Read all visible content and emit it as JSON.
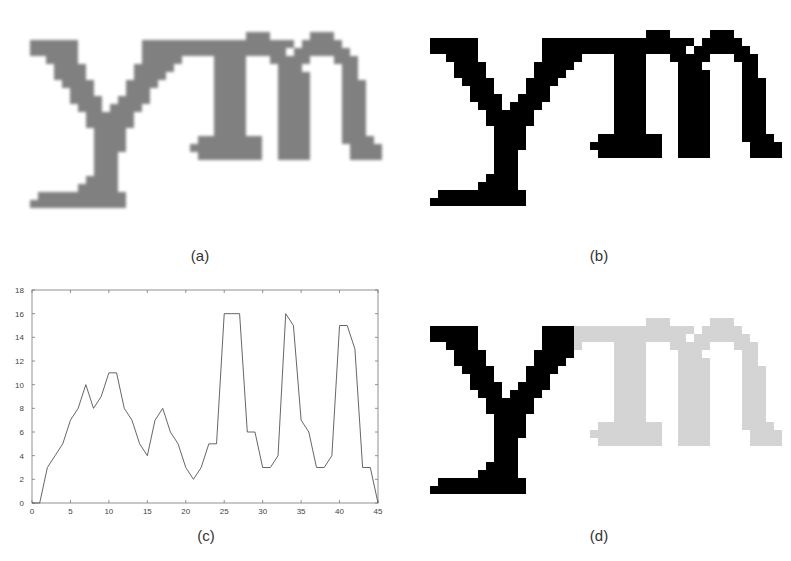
{
  "figure": {
    "panels": [
      {
        "id": "a",
        "caption": "(a)",
        "description": "grayscale low-resolution text image 'ym'"
      },
      {
        "id": "b",
        "caption": "(b)",
        "description": "binarized text image 'ym'"
      },
      {
        "id": "c",
        "caption": "(c)",
        "description": "vertical projection profile"
      },
      {
        "id": "d",
        "caption": "(d)",
        "description": "segmented character 'y' highlighted, 'm' greyed"
      }
    ],
    "glyph_text": "ym",
    "colors": {
      "grayscale_ink": "#6a6a6a",
      "binary_ink": "#000000",
      "segment_dim": "#d4d4d4",
      "chart_line": "#555555",
      "axis": "#777777"
    }
  },
  "bitmap": {
    "cols": 44,
    "rows": 23,
    "cell": 8,
    "split_col": 18,
    "rows_spans": [
      [
        [
          27,
          29
        ],
        [
          35,
          37
        ]
      ],
      [
        [
          0,
          5
        ],
        [
          14,
          32
        ],
        [
          34,
          38
        ]
      ],
      [
        [
          0,
          5
        ],
        [
          14,
          31
        ],
        [
          33,
          39
        ]
      ],
      [
        [
          2,
          5
        ],
        [
          14,
          18
        ],
        [
          23,
          26
        ],
        [
          30,
          34
        ],
        [
          38,
          40
        ]
      ],
      [
        [
          3,
          6
        ],
        [
          13,
          17
        ],
        [
          23,
          26
        ],
        [
          31,
          33
        ],
        [
          39,
          40
        ]
      ],
      [
        [
          3,
          6
        ],
        [
          13,
          16
        ],
        [
          23,
          26
        ],
        [
          31,
          34
        ],
        [
          39,
          40
        ]
      ],
      [
        [
          4,
          7
        ],
        [
          12,
          15
        ],
        [
          23,
          26
        ],
        [
          31,
          34
        ],
        [
          39,
          41
        ]
      ],
      [
        [
          5,
          7
        ],
        [
          12,
          14
        ],
        [
          23,
          26
        ],
        [
          31,
          34
        ],
        [
          39,
          41
        ]
      ],
      [
        [
          5,
          8
        ],
        [
          11,
          14
        ],
        [
          23,
          26
        ],
        [
          31,
          34
        ],
        [
          39,
          41
        ]
      ],
      [
        [
          6,
          8
        ],
        [
          10,
          13
        ],
        [
          23,
          26
        ],
        [
          31,
          34
        ],
        [
          39,
          41
        ]
      ],
      [
        [
          7,
          9
        ],
        [
          10,
          12
        ],
        [
          23,
          26
        ],
        [
          31,
          34
        ],
        [
          39,
          41
        ]
      ],
      [
        [
          7,
          12
        ],
        [
          23,
          26
        ],
        [
          31,
          34
        ],
        [
          39,
          41
        ]
      ],
      [
        [
          8,
          11
        ],
        [
          23,
          26
        ],
        [
          31,
          34
        ],
        [
          39,
          41
        ]
      ],
      [
        [
          8,
          11
        ],
        [
          21,
          28
        ],
        [
          31,
          34
        ],
        [
          39,
          42
        ]
      ],
      [
        [
          8,
          11
        ],
        [
          20,
          28
        ],
        [
          31,
          34
        ],
        [
          40,
          43
        ]
      ],
      [
        [
          8,
          10
        ],
        [
          21,
          28
        ],
        [
          31,
          34
        ],
        [
          40,
          43
        ]
      ],
      [
        [
          8,
          10
        ]
      ],
      [
        [
          8,
          10
        ]
      ],
      [
        [
          7,
          10
        ]
      ],
      [
        [
          6,
          10
        ]
      ],
      [
        [
          1,
          11
        ]
      ],
      [
        [
          0,
          11
        ]
      ]
    ]
  },
  "chart_data": {
    "type": "line",
    "title": "",
    "xlabel": "",
    "ylabel": "",
    "x": [
      0,
      1,
      2,
      3,
      4,
      5,
      6,
      7,
      8,
      9,
      10,
      11,
      12,
      13,
      14,
      15,
      16,
      17,
      18,
      19,
      20,
      21,
      22,
      23,
      24,
      25,
      26,
      27,
      28,
      29,
      30,
      31,
      32,
      33,
      34,
      35,
      36,
      37,
      38,
      39,
      40,
      41,
      42,
      43,
      44,
      45
    ],
    "series": [
      {
        "name": "projection",
        "values": [
          0,
          0,
          3,
          4,
          5,
          7,
          8,
          10,
          8,
          9,
          11,
          11,
          8,
          7,
          5,
          4,
          7,
          8,
          6,
          5,
          3,
          2,
          3,
          5,
          5,
          16,
          16,
          16,
          6,
          6,
          3,
          3,
          4,
          16,
          15,
          7,
          6,
          3,
          3,
          4,
          15,
          15,
          13,
          3,
          3,
          0
        ]
      }
    ],
    "xlim": [
      0,
      45
    ],
    "ylim": [
      0,
      18
    ],
    "xticks": [
      "0",
      "5",
      "10",
      "15",
      "20",
      "25",
      "30",
      "35",
      "40",
      "45"
    ],
    "yticks": [
      "0",
      "2",
      "4",
      "6",
      "8",
      "10",
      "12",
      "14",
      "16",
      "18"
    ],
    "grid": false,
    "legend": null
  }
}
